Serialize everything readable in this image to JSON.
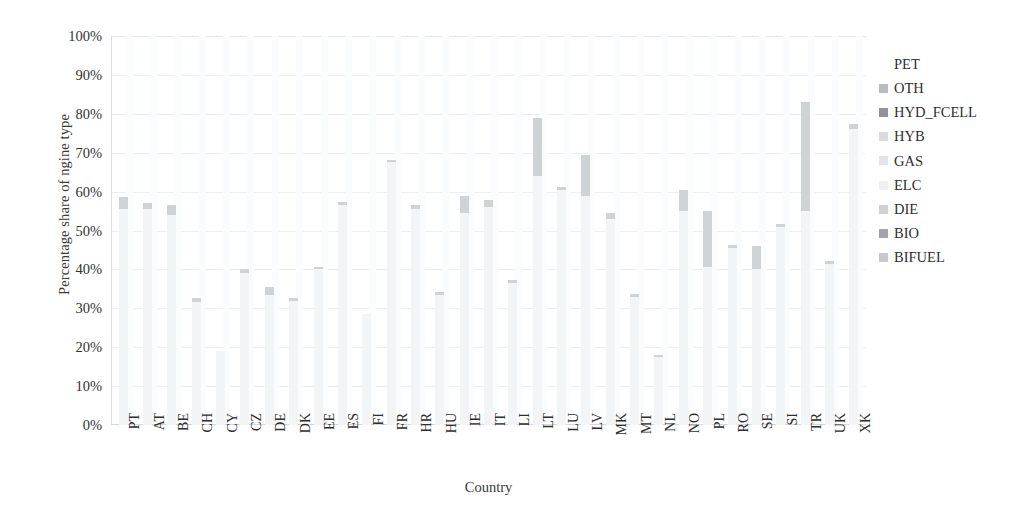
{
  "chart_data": {
    "type": "bar",
    "stacked": true,
    "title": "",
    "xlabel": "Country",
    "ylabel": "Percentage share of ngine type",
    "ylim": [
      0,
      100
    ],
    "ytick_labels": [
      "100%",
      "90%",
      "80%",
      "70%",
      "60%",
      "50%",
      "40%",
      "30%",
      "20%",
      "10%",
      "0%"
    ],
    "ytick_values": [
      100,
      90,
      80,
      70,
      60,
      50,
      40,
      30,
      20,
      10,
      0
    ],
    "grid": true,
    "legend_position": "right",
    "legend_entries": [
      "PET",
      "OTH",
      "HYD_FCELL",
      "HYB",
      "GAS",
      "ELC",
      "DIE",
      "BIO",
      "BIFUEL"
    ],
    "series_colors": {
      "PET": "#f3f4f5",
      "OTH": "#b9bcc0",
      "HYD_FCELL": "#8f9296",
      "HYB": "#d9dbde",
      "GAS": "#e2e4e6",
      "ELC": "#eff0f1",
      "DIE": "#d0d3d6",
      "BIO": "#a2a5a9",
      "BIFUEL": "#c6c9cc"
    },
    "categories": [
      "PT",
      "AT",
      "BE",
      "CH",
      "CY",
      "CZ",
      "DE",
      "DK",
      "EE",
      "ES",
      "FI",
      "FR",
      "HR",
      "HU",
      "IE",
      "IT",
      "LI",
      "LT",
      "LU",
      "LV",
      "MK",
      "MT",
      "NL",
      "NO",
      "PL",
      "RO",
      "SE",
      "SI",
      "TR",
      "UK",
      "XK"
    ],
    "series": [
      {
        "name": "PET",
        "values": [
          55.5,
          55.5,
          54.0,
          31.5,
          19.0,
          39.0,
          33.5,
          32.0,
          40.0,
          56.5,
          28.5,
          67.5,
          55.5,
          33.5,
          54.5,
          56.0,
          36.5,
          64.0,
          60.5,
          59.0,
          53.0,
          33.0,
          17.5,
          55.0,
          40.5,
          45.5,
          40.0,
          51.0,
          55.0,
          41.5,
          76.0
        ]
      },
      {
        "name": "DIE",
        "values": [
          3.0,
          1.5,
          2.5,
          1.2,
          0.0,
          1.0,
          2.0,
          0.6,
          0.6,
          0.8,
          0.0,
          0.6,
          1.0,
          0.6,
          4.5,
          1.8,
          0.8,
          15.0,
          0.6,
          10.5,
          1.5,
          0.6,
          0.5,
          5.5,
          14.5,
          0.8,
          6.0,
          0.6,
          28.0,
          0.6,
          1.5
        ]
      }
    ],
    "totals": [
      58.5,
      57.0,
      56.5,
      32.7,
      19.0,
      40.0,
      35.5,
      32.6,
      40.6,
      57.3,
      28.5,
      68.1,
      56.5,
      34.1,
      59.0,
      57.8,
      37.3,
      79.0,
      61.1,
      69.5,
      54.5,
      33.6,
      18.0,
      60.5,
      55.0,
      46.3,
      46.0,
      51.6,
      83.0,
      42.1,
      77.5
    ]
  },
  "axes": {
    "y_title": "Percentage share of ngine type",
    "x_title": "Country"
  },
  "legend": {
    "items": [
      {
        "label": "PET",
        "color": "#f3f4f5"
      },
      {
        "label": "OTH",
        "color": "#b9bcc0"
      },
      {
        "label": "HYD_FCELL",
        "color": "#8f9296"
      },
      {
        "label": "HYB",
        "color": "#d9dbde"
      },
      {
        "label": "GAS",
        "color": "#e2e4e6"
      },
      {
        "label": "ELC",
        "color": "#eff0f1"
      },
      {
        "label": "DIE",
        "color": "#d0d3d6"
      },
      {
        "label": "BIO",
        "color": "#a2a5a9"
      },
      {
        "label": "BIFUEL",
        "color": "#c6c9cc"
      }
    ]
  }
}
